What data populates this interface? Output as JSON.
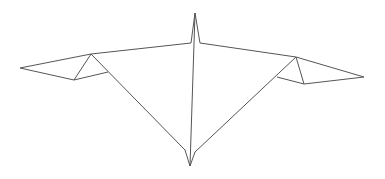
{
  "diagram": {
    "type": "line-drawing",
    "stroke_color": "#555555",
    "background": "#ffffff",
    "paths": [
      {
        "name": "top-edge-left",
        "points": "20,68 91,54 191,43"
      },
      {
        "name": "top-spike",
        "points": "191,43 195,13 200,43"
      },
      {
        "name": "top-edge-right",
        "points": "200,43 296,57 364,77"
      },
      {
        "name": "left-wing-lower",
        "points": "20,68 74,80 108,72"
      },
      {
        "name": "left-wing-fold",
        "points": "74,80 91,54 185,150"
      },
      {
        "name": "center-spine",
        "points": "195,13 190,166"
      },
      {
        "name": "bottom-spike",
        "points": "185,150 190,166 195,152"
      },
      {
        "name": "right-wing-fold",
        "points": "195,152 296,57 304,84"
      },
      {
        "name": "right-wing-lower",
        "points": "277,77 304,84 364,77"
      }
    ]
  }
}
